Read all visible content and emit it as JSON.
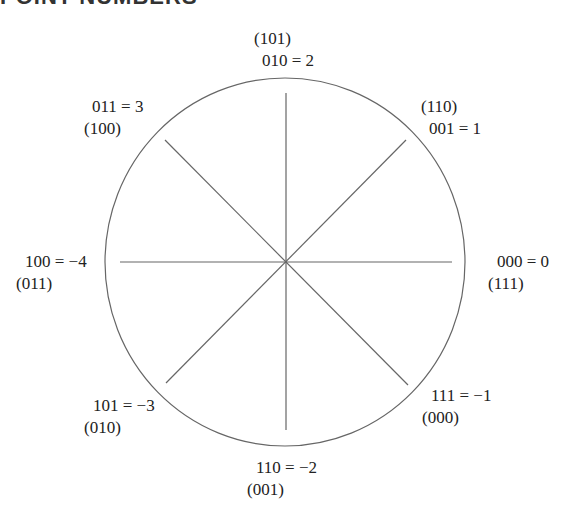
{
  "heading": "POINT NUMBERS",
  "diagram": {
    "type": "number-wheel",
    "center": [
      285,
      262
    ],
    "radius_x": 180,
    "radius_y": 184,
    "spokes": 8,
    "stroke_color": "#666666"
  },
  "labels": {
    "top": {
      "complement": "(101)",
      "value": "010 = 2"
    },
    "top_right": {
      "complement": "(110)",
      "value": "001 = 1"
    },
    "right": {
      "value": "000 = 0",
      "complement": "(111)"
    },
    "bottom_right": {
      "value": "111 = −1",
      "complement": "(000)"
    },
    "bottom": {
      "value": "110 = −2",
      "complement": "(001)"
    },
    "bottom_left": {
      "value": "101 = −3",
      "complement": "(010)"
    },
    "left": {
      "value": "100 = −4",
      "complement": "(011)"
    },
    "top_left": {
      "value": "011 = 3",
      "complement": "(100)"
    }
  }
}
